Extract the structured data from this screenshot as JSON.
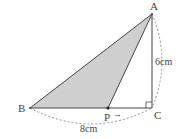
{
  "diagram": {
    "type": "geometry-right-triangle",
    "points": {
      "A": {
        "label": "A",
        "x": 152,
        "y": 14
      },
      "B": {
        "label": "B",
        "x": 30,
        "y": 108
      },
      "C": {
        "label": "C",
        "x": 152,
        "y": 108
      },
      "P": {
        "label": "P",
        "x": 108,
        "y": 108
      }
    },
    "shaded_region": "ABP",
    "right_angle_at": "C",
    "measurements": {
      "AC": "6cm",
      "BC": "8cm"
    },
    "motion_arrow": "→",
    "colors": {
      "fill": "#cfcfcf",
      "stroke": "#444444",
      "dashed": "#777777"
    }
  }
}
